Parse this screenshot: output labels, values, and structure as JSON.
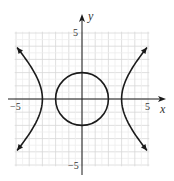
{
  "chart_data": {
    "type": "line",
    "title": "",
    "xlabel": "x",
    "ylabel": "y",
    "xlim": [
      -5,
      5
    ],
    "ylim": [
      -5,
      5
    ],
    "grid": true,
    "x_ticks": [
      {
        "value": -5,
        "label": "−5"
      },
      {
        "value": 5,
        "label": "5"
      }
    ],
    "y_ticks": [
      {
        "value": 5,
        "label": "5"
      },
      {
        "value": -5,
        "label": "−5"
      }
    ],
    "series": [
      {
        "name": "circle",
        "equation": "x^2 + y^2 = 4",
        "center": [
          0,
          0
        ],
        "radius": 2
      },
      {
        "name": "hyperbola",
        "equation": "x^2/9 - y^2/9 = 1",
        "vertices": [
          [
            -3,
            0
          ],
          [
            3,
            0
          ]
        ],
        "branches": 2,
        "arrows": true,
        "arrow_endpoints": [
          [
            -4.9,
            3.9
          ],
          [
            -4.9,
            -3.9
          ],
          [
            4.9,
            3.9
          ],
          [
            4.9,
            -3.9
          ]
        ]
      }
    ],
    "colors": {
      "curve": "#1a1a1a",
      "grid": "#dcdcdc",
      "axis": "#1a1a1a"
    }
  }
}
